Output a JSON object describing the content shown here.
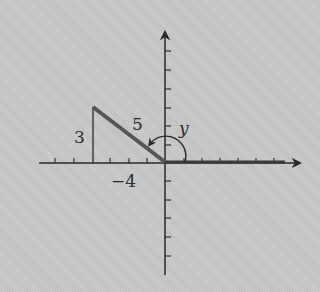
{
  "diagram": {
    "type": "coordinate-plane-angle",
    "origin_px": [
      165,
      163
    ],
    "unit_px": 18.3,
    "labels": {
      "hypotenuse": "5",
      "opposite": "3",
      "adjacent": "−4",
      "angle": "y"
    },
    "point": {
      "x": -4,
      "y": 3
    },
    "colors": {
      "background": "#c8c8c8",
      "axis": "#2a2a2a",
      "terminal_side": "#555555",
      "initial_side": "#3a3a3a"
    }
  }
}
